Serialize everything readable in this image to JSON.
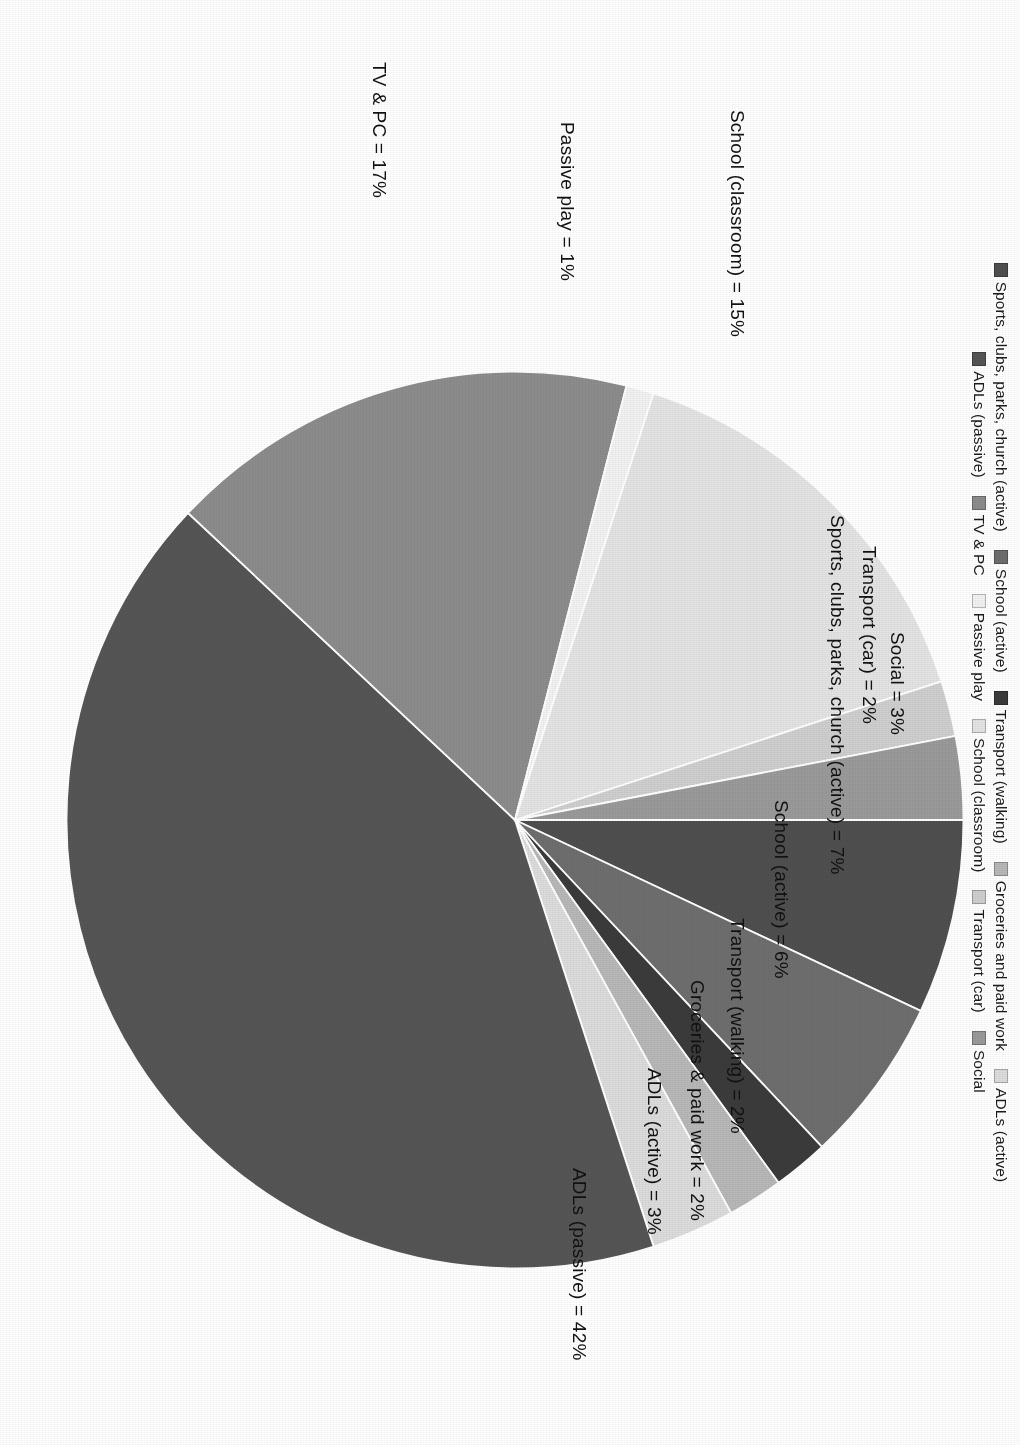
{
  "chart_data": {
    "type": "pie",
    "title": "",
    "subtitle": "",
    "xlabel": "",
    "ylabel": "",
    "legend_position": "top",
    "grid": false,
    "units": "percent",
    "categories": [
      "Sports, clubs, parks, church (active)",
      "School (active)",
      "Transport (walking)",
      "Groceries and paid work",
      "ADLs (active)",
      "ADLs (passive)",
      "TV & PC",
      "Passive play",
      "School (classroom)",
      "Transport (car)",
      "Social"
    ],
    "values": [
      7,
      6,
      2,
      2,
      3,
      42,
      17,
      1,
      15,
      2,
      3
    ],
    "colors": [
      "#4f4f4f",
      "#6e6e6e",
      "#3b3b3b",
      "#b8b8b8",
      "#dcdcdc",
      "#555555",
      "#8c8c8c",
      "#f2f2f2",
      "#e4e4e4",
      "#cfcfcf",
      "#9a9a9a"
    ],
    "data_labels": [
      "Sports, clubs, parks, church (active) = 7%",
      "School (active) = 6%",
      "Transport (walking) = 2%",
      "Groceries & paid work = 2%",
      "ADLs (active) = 3%",
      "ADLs (passive) = 42%",
      "TV & PC = 17%",
      "Passive play = 1%",
      "School (classroom) = 15%",
      "Transport (car) = 2%",
      "Social = 3%"
    ]
  },
  "legend": {
    "rows": [
      [
        {
          "label": "Sports, clubs, parks, church (active)",
          "color": "#4f4f4f"
        },
        {
          "label": "School (active)",
          "color": "#6e6e6e"
        },
        {
          "label": "Transport (walking)",
          "color": "#3b3b3b"
        },
        {
          "label": "Groceries and paid work",
          "color": "#b8b8b8"
        },
        {
          "label": "ADLs (active)",
          "color": "#dcdcdc"
        }
      ],
      [
        {
          "label": "ADLs (passive)",
          "color": "#555555"
        },
        {
          "label": "TV & PC",
          "color": "#8c8c8c"
        },
        {
          "label": "Passive play",
          "color": "#f2f2f2"
        },
        {
          "label": "School (classroom)",
          "color": "#e4e4e4"
        },
        {
          "label": "Transport (car)",
          "color": "#cfcfcf"
        },
        {
          "label": "Social",
          "color": "#9a9a9a"
        }
      ]
    ]
  },
  "callouts": [
    {
      "id": "adls-passive",
      "text": "ADLs (passive) = 42%"
    },
    {
      "id": "adls-active",
      "text": "ADLs (active) = 3%"
    },
    {
      "id": "groceries",
      "text": "Groceries & paid work = 2%"
    },
    {
      "id": "transport-walking",
      "text": "Transport (walking) = 2%"
    },
    {
      "id": "school-active",
      "text": "School (active) = 6%"
    },
    {
      "id": "sports",
      "text": "Sports, clubs, parks, church (active) = 7%"
    },
    {
      "id": "social",
      "text": "Social = 3%"
    },
    {
      "id": "transport-car",
      "text": "Transport (car) = 2%"
    },
    {
      "id": "school-classroom",
      "text": "School (classroom) = 15%"
    },
    {
      "id": "passive-play",
      "text": "Passive play = 1%"
    },
    {
      "id": "tv-pc",
      "text": "TV & PC = 17%"
    }
  ]
}
